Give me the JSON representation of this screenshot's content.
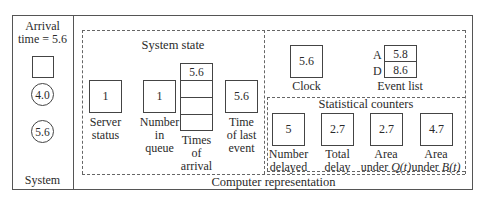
{
  "system": {
    "arrival_label": "Arrival\ntime = 5.6",
    "server_square": "",
    "queue_circles": [
      "4.0",
      "5.6"
    ],
    "label": "System"
  },
  "computer_representation": {
    "label": "Computer representation",
    "system_state": {
      "title": "System state",
      "server_status": {
        "value": "1",
        "label": "Server\nstatus"
      },
      "number_in_queue": {
        "value": "1",
        "label": "Number\nin\nqueue"
      },
      "times_of_arrival": {
        "values": [
          "5.6",
          "",
          "",
          ""
        ],
        "label": "Times\nof\narrival"
      },
      "time_of_last_event": {
        "value": "5.6",
        "label": "Time\nof last\nevent"
      }
    },
    "clock": {
      "value": "5.6",
      "label": "Clock"
    },
    "event_list": {
      "label": "Event list",
      "rows": [
        {
          "key": "A",
          "value": "5.8"
        },
        {
          "key": "D",
          "value": "8.6"
        }
      ]
    },
    "statistical_counters": {
      "title": "Statistical counters",
      "items": [
        {
          "value": "5",
          "label": "Number\ndelayed"
        },
        {
          "value": "2.7",
          "label": "Total\ndelay"
        },
        {
          "value": "2.7",
          "label_pre": "Area\nunder ",
          "label_var": "Q(t)"
        },
        {
          "value": "4.7",
          "label_pre": "Area\nunder ",
          "label_var": "B(t)"
        }
      ]
    }
  }
}
